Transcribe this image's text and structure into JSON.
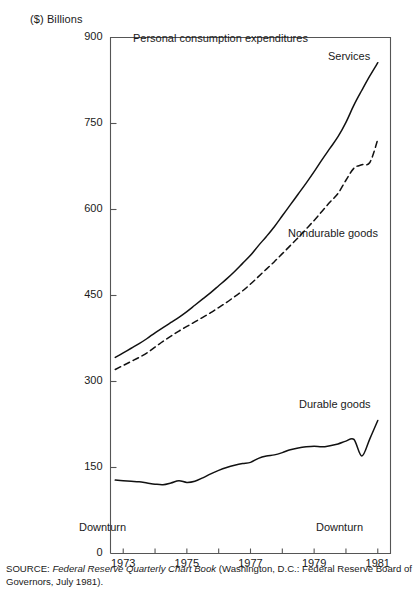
{
  "axis": {
    "unit_label": "($) Billions",
    "y_ticks": [
      900,
      750,
      600,
      450,
      300,
      150,
      0
    ],
    "y_tick_labels": [
      "900",
      "750",
      "600",
      "450",
      "300",
      "150",
      "0"
    ],
    "x_ticks": [
      1973,
      1974,
      1975,
      1976,
      1977,
      1978,
      1979,
      1980,
      1981
    ],
    "x_tick_labels": [
      "1973",
      "1975",
      "1977",
      "1979",
      "1981"
    ],
    "x_labeled_ticks": [
      1973,
      1975,
      1977,
      1979,
      1981
    ]
  },
  "plot_title": "Personal consumption expenditures",
  "annotations": {
    "downturn_1": "Downturn",
    "downturn_2": "Downturn"
  },
  "series_labels": {
    "services": "Services",
    "nondurable": "Nondurable goods",
    "durable": "Durable goods"
  },
  "source": {
    "prefix": "SOURCE: ",
    "italic": "Federal Reserve Quarterly Chart Book",
    "rest": " (Washington, D.C.: Federal Reserve Board of Governors, July 1981)."
  },
  "colors": {
    "line": "#111111",
    "frame": "#555555",
    "text": "#1a1a1a",
    "background": "#ffffff"
  },
  "chart_data": {
    "type": "line",
    "title": "Personal consumption expenditures",
    "xlabel": "",
    "ylabel": "($) Billions",
    "xlim": [
      1972.6,
      1981.4
    ],
    "ylim": [
      0,
      900
    ],
    "grid": false,
    "legend": "inline-labels",
    "x": [
      1972.75,
      1973,
      1973.25,
      1973.5,
      1973.75,
      1974,
      1974.25,
      1974.5,
      1974.75,
      1975,
      1975.25,
      1975.5,
      1975.75,
      1976,
      1976.25,
      1976.5,
      1976.75,
      1977,
      1977.25,
      1977.5,
      1977.75,
      1978,
      1978.25,
      1978.5,
      1978.75,
      1979,
      1979.25,
      1979.5,
      1979.75,
      1980,
      1980.25,
      1980.5,
      1980.75,
      1981
    ],
    "series": [
      {
        "name": "Services",
        "style": "solid",
        "values": [
          342,
          350,
          358,
          366,
          375,
          385,
          394,
          403,
          412,
          422,
          433,
          444,
          455,
          467,
          479,
          492,
          506,
          520,
          537,
          553,
          570,
          589,
          608,
          627,
          646,
          666,
          687,
          707,
          727,
          752,
          782,
          808,
          833,
          856
        ]
      },
      {
        "name": "Nondurable goods",
        "style": "dashed",
        "values": [
          321,
          328,
          335,
          342,
          350,
          360,
          370,
          379,
          388,
          396,
          404,
          412,
          420,
          429,
          438,
          448,
          458,
          470,
          483,
          496,
          509,
          523,
          537,
          551,
          566,
          581,
          597,
          613,
          628,
          651,
          672,
          678,
          682,
          722
        ]
      },
      {
        "name": "Durable goods",
        "style": "solid",
        "values": [
          128,
          127,
          126,
          125,
          123,
          121,
          120,
          123,
          127,
          124,
          126,
          132,
          139,
          145,
          150,
          154,
          157,
          159,
          166,
          170,
          172,
          176,
          181,
          184,
          186,
          187,
          186,
          188,
          191,
          196,
          199,
          170,
          200,
          232
        ]
      }
    ]
  }
}
